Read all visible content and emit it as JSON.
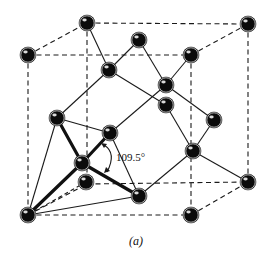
{
  "figure": {
    "angle_label": "109.5°",
    "caption": "(a)",
    "colors": {
      "atom": "#0b0b0b",
      "line": "#1a1a1a",
      "background": "#ffffff"
    },
    "atoms": [
      {
        "id": "back-top-left",
        "x": 87,
        "y": 23
      },
      {
        "id": "back-top-right",
        "x": 248,
        "y": 24
      },
      {
        "id": "front-top-left",
        "x": 28,
        "y": 55
      },
      {
        "id": "front-top-right",
        "x": 191,
        "y": 55
      },
      {
        "id": "top-face-center",
        "x": 139,
        "y": 40
      },
      {
        "id": "interior-upper-left",
        "x": 109,
        "y": 70
      },
      {
        "id": "interior-upper-right",
        "x": 166,
        "y": 85
      },
      {
        "id": "back-face-center",
        "x": 166,
        "y": 105
      },
      {
        "id": "left-face-center",
        "x": 57,
        "y": 118
      },
      {
        "id": "front-face-center",
        "x": 110,
        "y": 133
      },
      {
        "id": "right-face-center",
        "x": 214,
        "y": 120
      },
      {
        "id": "interior-lower-left",
        "x": 82,
        "y": 163
      },
      {
        "id": "back-bottom-left",
        "x": 87,
        "y": 184
      },
      {
        "id": "interior-lower-right",
        "x": 193,
        "y": 151
      },
      {
        "id": "back-bottom-right",
        "x": 248,
        "y": 182
      },
      {
        "id": "bottom-face-center",
        "x": 139,
        "y": 196
      },
      {
        "id": "front-bottom-left",
        "x": 28,
        "y": 215
      },
      {
        "id": "front-bottom-right",
        "x": 191,
        "y": 215
      }
    ]
  }
}
